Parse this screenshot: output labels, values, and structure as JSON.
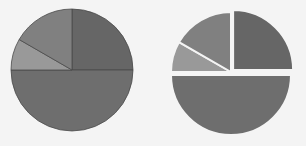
{
  "chart_data": [
    {
      "type": "pie",
      "title": "",
      "labels": [
        "A",
        "B",
        "C",
        "D"
      ],
      "values": [
        25,
        50,
        8.33,
        16.67
      ],
      "colors": [
        "#666666",
        "#6e6e6e",
        "#999999",
        "#808080"
      ],
      "start_angle": "12 o'clock, clockwise",
      "exploded": false,
      "center": [
        72,
        70
      ],
      "radius": 61
    },
    {
      "type": "pie",
      "title": "",
      "labels": [
        "A",
        "B",
        "C",
        "D"
      ],
      "values": [
        25,
        50,
        8.33,
        16.67
      ],
      "colors": [
        "#666666",
        "#6e6e6e",
        "#999999",
        "#808080"
      ],
      "start_angle": "12 o'clock, clockwise",
      "exploded": true,
      "center": [
        231,
        72
      ],
      "radius": 60
    }
  ]
}
